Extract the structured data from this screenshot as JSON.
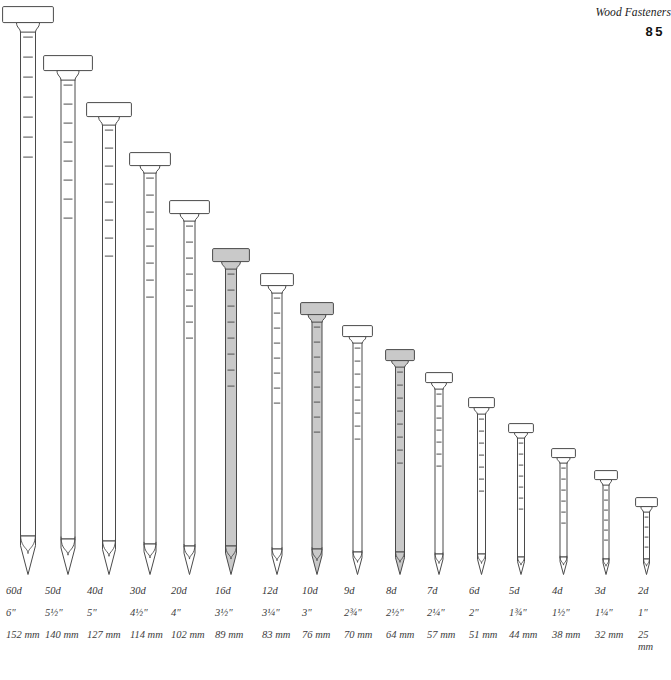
{
  "header": {
    "title": "Wood Fasteners",
    "page_number": "85"
  },
  "figure": {
    "caption": "",
    "shaded_color": "#c9c9c9",
    "plain_color": "#ffffff",
    "outline_color": "#4a4a4a"
  },
  "chart_data": {
    "type": "bar",
    "xlabel": "",
    "ylabel": "Length",
    "categories": [
      "60d",
      "50d",
      "40d",
      "30d",
      "20d",
      "16d",
      "12d",
      "10d",
      "9d",
      "8d",
      "7d",
      "6d",
      "5d",
      "4d",
      "3d",
      "2d"
    ],
    "values": [
      152,
      140,
      127,
      114,
      102,
      89,
      83,
      76,
      70,
      64,
      57,
      51,
      44,
      38,
      32,
      25
    ],
    "units": "mm",
    "ylim": [
      0,
      160
    ]
  },
  "nails": [
    {
      "penny": "60d",
      "inches": "6\"",
      "mm": "152 mm",
      "mm_value": 152,
      "shaded": false,
      "x": 2,
      "head_top": 6,
      "head_w": 52,
      "shank_w": 15,
      "ridges": 7,
      "wrap": false,
      "label_x": 6
    },
    {
      "penny": "50d",
      "inches": "5½\"",
      "mm": "140 mm",
      "mm_value": 140,
      "shaded": false,
      "x": 43,
      "head_top": 55,
      "head_w": 50,
      "shank_w": 14,
      "ridges": 8,
      "wrap": false,
      "label_x": 45
    },
    {
      "penny": "40d",
      "inches": "5\"",
      "mm": "127 mm",
      "mm_value": 127,
      "shaded": false,
      "x": 86,
      "head_top": 102,
      "head_w": 46,
      "shank_w": 13,
      "ridges": 8,
      "wrap": false,
      "label_x": 87
    },
    {
      "penny": "30d",
      "inches": "4½\"",
      "mm": "114 mm",
      "mm_value": 114,
      "shaded": false,
      "x": 129,
      "head_top": 152,
      "head_w": 42,
      "shank_w": 12,
      "ridges": 8,
      "wrap": false,
      "label_x": 130
    },
    {
      "penny": "20d",
      "inches": "4\"",
      "mm": "102 mm",
      "mm_value": 102,
      "shaded": false,
      "x": 169,
      "head_top": 200,
      "head_w": 41,
      "shank_w": 11,
      "ridges": 8,
      "wrap": false,
      "label_x": 171
    },
    {
      "penny": "16d",
      "inches": "3½\"",
      "mm": "89 mm",
      "mm_value": 89,
      "shaded": true,
      "x": 212,
      "head_top": 248,
      "head_w": 38,
      "shank_w": 11,
      "ridges": 8,
      "wrap": false,
      "label_x": 215
    },
    {
      "penny": "12d",
      "inches": "3¼\"",
      "mm": "83 mm",
      "mm_value": 83,
      "shaded": false,
      "x": 260,
      "head_top": 273,
      "head_w": 34,
      "shank_w": 10,
      "ridges": 8,
      "wrap": false,
      "label_x": 262
    },
    {
      "penny": "10d",
      "inches": "3\"",
      "mm": "76 mm",
      "mm_value": 76,
      "shaded": true,
      "x": 300,
      "head_top": 302,
      "head_w": 34,
      "shank_w": 10,
      "ridges": 8,
      "wrap": false,
      "label_x": 302
    },
    {
      "penny": "9d",
      "inches": "2¾\"",
      "mm": "70 mm",
      "mm_value": 70,
      "shaded": false,
      "x": 342,
      "head_top": 325,
      "head_w": 31,
      "shank_w": 9,
      "ridges": 8,
      "wrap": false,
      "label_x": 344
    },
    {
      "penny": "8d",
      "inches": "2½\"",
      "mm": "64 mm",
      "mm_value": 64,
      "shaded": true,
      "x": 385,
      "head_top": 349,
      "head_w": 30,
      "shank_w": 9,
      "ridges": 8,
      "wrap": false,
      "label_x": 386
    },
    {
      "penny": "7d",
      "inches": "2¼\"",
      "mm": "57 mm",
      "mm_value": 57,
      "shaded": false,
      "x": 425,
      "head_top": 372,
      "head_w": 28,
      "shank_w": 8,
      "ridges": 7,
      "wrap": false,
      "label_x": 427
    },
    {
      "penny": "6d",
      "inches": "2\"",
      "mm": "51 mm",
      "mm_value": 51,
      "shaded": false,
      "x": 468,
      "head_top": 397,
      "head_w": 27,
      "shank_w": 8,
      "ridges": 7,
      "wrap": false,
      "label_x": 469
    },
    {
      "penny": "5d",
      "inches": "1¾\"",
      "mm": "44 mm",
      "mm_value": 44,
      "shaded": false,
      "x": 508,
      "head_top": 423,
      "head_w": 26,
      "shank_w": 7,
      "ridges": 7,
      "wrap": false,
      "label_x": 509
    },
    {
      "penny": "4d",
      "inches": "1½\"",
      "mm": "38 mm",
      "mm_value": 38,
      "shaded": false,
      "x": 551,
      "head_top": 448,
      "head_w": 25,
      "shank_w": 7,
      "ridges": 6,
      "wrap": false,
      "label_x": 552
    },
    {
      "penny": "3d",
      "inches": "1¼\"",
      "mm": "32 mm",
      "mm_value": 32,
      "shaded": false,
      "x": 594,
      "head_top": 470,
      "head_w": 24,
      "shank_w": 6,
      "ridges": 6,
      "wrap": false,
      "label_x": 595
    },
    {
      "penny": "2d",
      "inches": "1\"",
      "mm": "25 mm",
      "mm_value": 25,
      "shaded": false,
      "x": 635,
      "head_top": 497,
      "head_w": 23,
      "shank_w": 6,
      "ridges": 5,
      "wrap": true,
      "label_x": 638
    }
  ]
}
